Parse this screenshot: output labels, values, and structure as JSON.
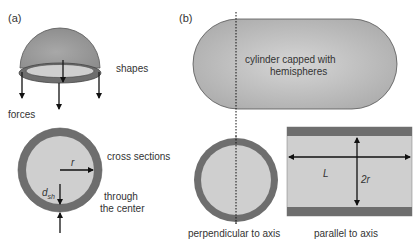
{
  "panels": {
    "a": {
      "tag": "(a)",
      "labels": {
        "shapes": "shapes",
        "forces": "forces",
        "cross_sections": "cross sections",
        "through": "through",
        "the_center": "the center",
        "radius": "r",
        "thickness_d": "d",
        "thickness_sub": "sh"
      }
    },
    "b": {
      "tag": "(b)",
      "labels": {
        "capsule_line1": "cylinder capped with",
        "capsule_line2": "hemispheres",
        "perpendicular": "perpendicular to axis",
        "parallel": "parallel to axis",
        "length": "L",
        "diameter": "2r"
      }
    }
  },
  "colors": {
    "shell": "#6e6e6e",
    "interior": "#cfcfcf",
    "capsule_fill": "#bdbdbd",
    "outline": "#555555",
    "arrow": "#111111"
  }
}
